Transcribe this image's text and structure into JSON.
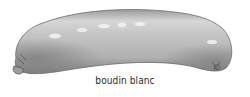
{
  "caption": "boudin blanc",
  "image": {
    "subject": "sausage-illustration",
    "style": "grayscale",
    "colors": {
      "highlight": "#e8e8e8",
      "body": "#bdbdbd",
      "shadow": "#7a7a7a",
      "outline": "#555555",
      "caption_text": "#2a2a2a",
      "background": "#ffffff"
    }
  }
}
